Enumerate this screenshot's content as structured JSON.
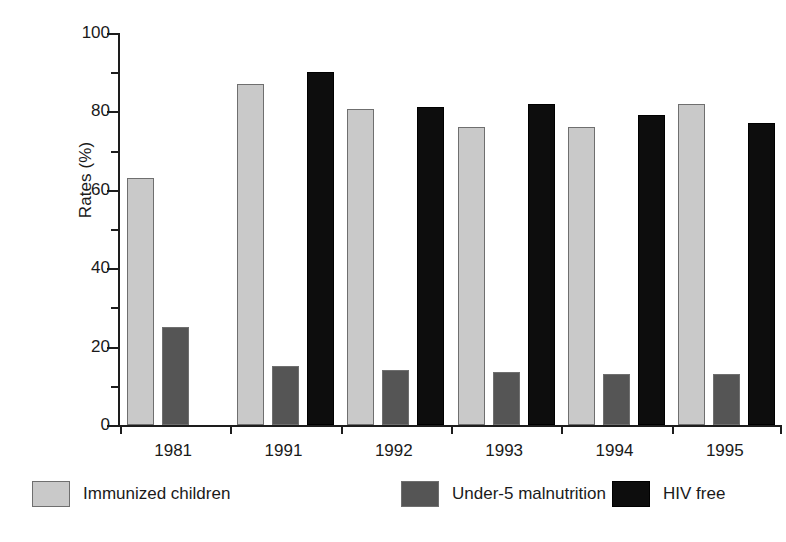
{
  "chart_data": {
    "type": "bar",
    "title": "",
    "xlabel": "",
    "ylabel": "Rates (%)",
    "categories": [
      "1981",
      "1991",
      "1992",
      "1993",
      "1994",
      "1995"
    ],
    "ylim": [
      0,
      100
    ],
    "ytick_labels": [
      "0",
      "20",
      "40",
      "60",
      "80",
      "100"
    ],
    "ytick_values": [
      0,
      20,
      40,
      60,
      80,
      100
    ],
    "yminor_values": [
      10,
      30,
      50,
      70,
      90
    ],
    "grid": false,
    "legend_position": "bottom",
    "series": [
      {
        "name": "Immunized children",
        "color": "#c9c9c9",
        "values": [
          63,
          87,
          80.5,
          76,
          76,
          82
        ]
      },
      {
        "name": "Under-5 malnutrition",
        "color": "#555555",
        "values": [
          25,
          15,
          14,
          13.5,
          13,
          13
        ]
      },
      {
        "name": "HIV free",
        "color": "#0d0d0d",
        "values": [
          null,
          90,
          81,
          82,
          79,
          77
        ]
      }
    ]
  },
  "axis": {
    "y_title": "Rates (%)"
  },
  "legend": {
    "items": [
      {
        "label": "Immunized children",
        "color": "#c9c9c9"
      },
      {
        "label": "Under-5 malnutrition",
        "color": "#555555"
      },
      {
        "label": "HIV free",
        "color": "#0d0d0d"
      }
    ]
  }
}
